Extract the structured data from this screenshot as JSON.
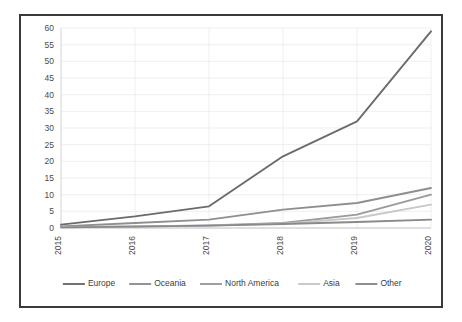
{
  "chart_data": {
    "type": "line",
    "title": "",
    "subtitle": "",
    "xlabel": "",
    "ylabel": "",
    "categories": [
      "2015",
      "2016",
      "2017",
      "2018",
      "2019",
      "2020"
    ],
    "x": [
      2015,
      2016,
      2017,
      2018,
      2019,
      2020
    ],
    "ylim": [
      0,
      60
    ],
    "ytick_labels": [
      "0",
      "5",
      "10",
      "15",
      "20",
      "25",
      "30",
      "35",
      "40",
      "45",
      "50",
      "55",
      "60"
    ],
    "ytick_values": [
      0,
      5,
      10,
      15,
      20,
      25,
      30,
      35,
      40,
      45,
      50,
      55,
      60
    ],
    "xtick_labels": [
      "2015",
      "2016",
      "2017",
      "2018",
      "2019",
      "2020"
    ],
    "xtick_label_rotation": -90,
    "grid": "horizontal",
    "legend_position": "bottom-center",
    "series": [
      {
        "name": "Europe",
        "color": "#6b6b6b",
        "values": [
          1,
          3.5,
          6.5,
          21.5,
          32,
          59
        ]
      },
      {
        "name": "Oceania",
        "color": "#8f8f8f",
        "values": [
          0.5,
          1.5,
          2.5,
          5.5,
          7.5,
          12
        ]
      },
      {
        "name": "North America",
        "color": "#9a9a9a",
        "values": [
          0.3,
          0.5,
          0.8,
          1.5,
          4,
          10
        ]
      },
      {
        "name": "Asia",
        "color": "#c8c8c8",
        "values": [
          0.2,
          0.4,
          0.7,
          1.3,
          3,
          7
        ]
      },
      {
        "name": "Other",
        "color": "#898989",
        "values": [
          0.2,
          0.4,
          0.7,
          1.2,
          1.8,
          2.5
        ]
      }
    ]
  },
  "style": {
    "frame_border_color": "#3a3a3a",
    "gridline_color": "#ebebeb",
    "axis_color": "#cfcfcf",
    "tick_text_color": "#4a4a4a",
    "legend_text_color": "#3c3c3c",
    "background": "#ffffff"
  }
}
